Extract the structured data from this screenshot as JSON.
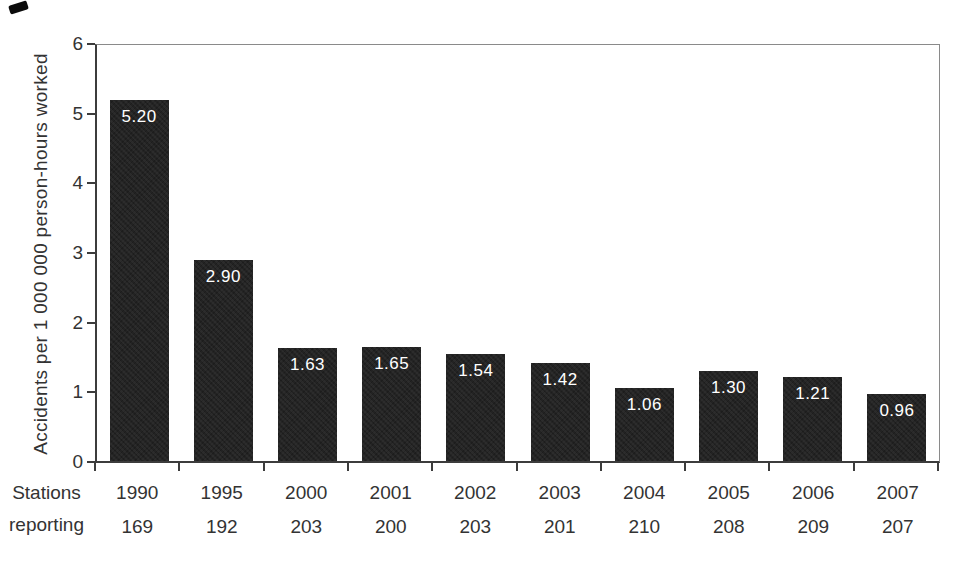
{
  "chart_data": {
    "type": "bar",
    "title": "",
    "xlabel": "",
    "ylabel": "Accidents per 1 000 000 person-hours worked",
    "ylim": [
      0,
      6
    ],
    "yticks": [
      0,
      1,
      2,
      3,
      4,
      5,
      6
    ],
    "grid": false,
    "legend": "none",
    "categories": [
      "1990",
      "1995",
      "2000",
      "2001",
      "2002",
      "2003",
      "2004",
      "2005",
      "2006",
      "2007"
    ],
    "values": [
      5.2,
      2.9,
      1.63,
      1.65,
      1.54,
      1.42,
      1.06,
      1.3,
      1.21,
      0.96
    ],
    "bar_value_labels": [
      "5.20",
      "2.90",
      "1.63",
      "1.65",
      "1.54",
      "1.42",
      "1.06",
      "1.30",
      "1.21",
      "0.96"
    ],
    "stations_reporting": [
      169,
      192,
      203,
      200,
      203,
      201,
      210,
      208,
      209,
      207
    ],
    "bar_color": "#232323",
    "bar_label_color": "#ffffff",
    "axis_color": "#3c3c3c",
    "text_color": "#333333"
  },
  "x_axis": {
    "row_label_line1": "Stations",
    "row_label_line2": "reporting"
  }
}
